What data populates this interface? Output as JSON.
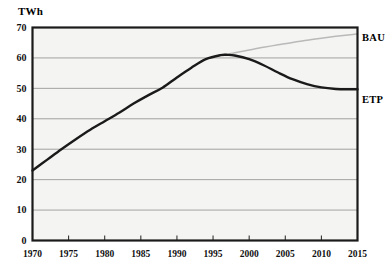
{
  "chart_data": {
    "type": "line",
    "title": "",
    "subtitle": "",
    "xlabel": "",
    "ylabel": "TWh",
    "unit": "TWh",
    "xlim": [
      1970,
      2015
    ],
    "ylim": [
      0,
      70
    ],
    "grid": true,
    "grid_axis": "y",
    "legend_position": "right-of-plot-inline",
    "x_ticks": [
      1970,
      1975,
      1980,
      1985,
      1990,
      1995,
      2000,
      2005,
      2010,
      2015
    ],
    "x_tick_labels": [
      "1970",
      "1975",
      "1980",
      "1985",
      "1990",
      "1995",
      "2000",
      "2005",
      "2010",
      "2015"
    ],
    "y_ticks": [
      0,
      10,
      20,
      30,
      40,
      50,
      60,
      70
    ],
    "y_tick_labels": [
      "0",
      "10",
      "20",
      "30",
      "40",
      "50",
      "60",
      "70"
    ],
    "series": [
      {
        "name": "ETP",
        "label": "ETP",
        "color": "#1a1a1a",
        "line_width": 2.4,
        "x": [
          1970,
          1972,
          1974,
          1976,
          1978,
          1980,
          1982,
          1984,
          1986,
          1988,
          1990,
          1992,
          1994,
          1996,
          1997,
          1998,
          2000,
          2002,
          2004,
          2006,
          2008,
          2010,
          2012,
          2014,
          2015
        ],
        "values": [
          23.0,
          26.5,
          30.0,
          33.3,
          36.4,
          39.2,
          42.0,
          45.0,
          47.7,
          50.2,
          53.6,
          56.8,
          59.6,
          60.9,
          61.0,
          60.8,
          59.6,
          57.6,
          55.2,
          53.0,
          51.4,
          50.3,
          49.8,
          49.7,
          49.7
        ]
      },
      {
        "name": "BAU",
        "label": "BAU",
        "color": "#b9b9b9",
        "line_width": 1.5,
        "x": [
          1996,
          1997,
          1998,
          2000,
          2002,
          2004,
          2006,
          2008,
          2010,
          2012,
          2014,
          2015
        ],
        "values": [
          60.9,
          61.2,
          61.7,
          62.6,
          63.5,
          64.3,
          65.1,
          65.8,
          66.5,
          67.1,
          67.6,
          67.9
        ]
      }
    ],
    "annotations": [
      {
        "text": "BAU",
        "target_series": "BAU",
        "placement": "right-end"
      },
      {
        "text": "ETP",
        "target_series": "ETP",
        "placement": "right-end"
      }
    ]
  },
  "axis": {
    "unit_label": "TWh"
  }
}
